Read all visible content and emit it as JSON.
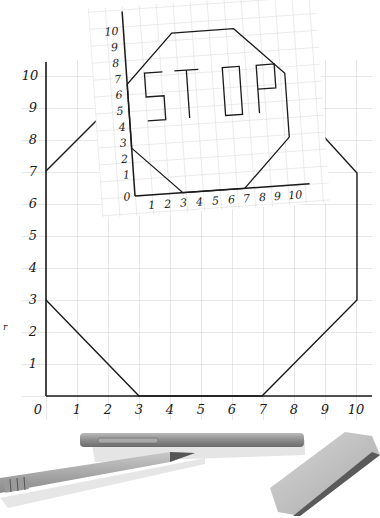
{
  "large_grid": {
    "x_axis": {
      "ticks": [
        "0",
        "1",
        "2",
        "3",
        "4",
        "5",
        "6",
        "7",
        "8",
        "9",
        "10"
      ],
      "range": [
        0,
        10
      ]
    },
    "y_axis": {
      "ticks": [
        "0",
        "1",
        "2",
        "3",
        "4",
        "5",
        "6",
        "7",
        "8",
        "9",
        "10"
      ],
      "range": [
        0,
        10
      ]
    },
    "octagon_points_visible": [
      [
        0,
        3
      ],
      [
        3,
        0
      ],
      [
        7,
        0
      ],
      [
        10,
        3
      ],
      [
        10,
        7
      ],
      [
        0,
        7
      ]
    ],
    "line_color": "#1a1a1a",
    "grid_color": "#cfcfcf"
  },
  "small_grid": {
    "x_axis": {
      "ticks": [
        "0",
        "1",
        "2",
        "3",
        "4",
        "5",
        "6",
        "7",
        "8",
        "9",
        "10"
      ]
    },
    "y_axis": {
      "ticks": [
        "0",
        "1",
        "2",
        "3",
        "4",
        "5",
        "6",
        "7",
        "8",
        "9",
        "10"
      ]
    },
    "octagon_points": [
      [
        0,
        3
      ],
      [
        3,
        0
      ],
      [
        7,
        0
      ],
      [
        10,
        3
      ],
      [
        10,
        7
      ],
      [
        7,
        10
      ],
      [
        3,
        10
      ],
      [
        0,
        7
      ]
    ],
    "label_text": "STOP",
    "letters": [
      "S",
      "T",
      "O",
      "P"
    ]
  },
  "objects": {
    "pen": "pen",
    "pencil": "pencil",
    "eraser": "eraser"
  }
}
